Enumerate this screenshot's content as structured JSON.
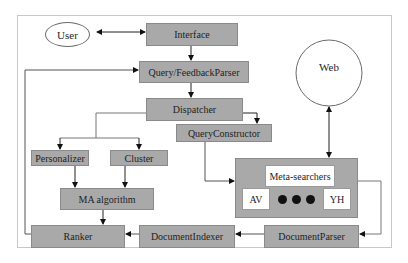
{
  "diagram": {
    "nodes": {
      "user": "User",
      "web": "Web",
      "interface": "Interface",
      "query_feedback_parser": "Query/FeedbackParser",
      "dispatcher": "Dispatcher",
      "personalizer": "Personalizer",
      "cluster": "Cluster",
      "query_constructor": "QueryConstructor",
      "ma_algorithm": "MA algorithm",
      "meta_searchers": "Meta-searchers",
      "av": "AV",
      "yh": "YH",
      "ranker": "Ranker",
      "document_indexer": "DocumentIndexer",
      "document_parser": "DocumentParser"
    },
    "edges": [
      {
        "from": "User",
        "to": "Interface",
        "bidirectional": true
      },
      {
        "from": "Interface",
        "to": "Query/FeedbackParser"
      },
      {
        "from": "Query/FeedbackParser",
        "to": "Dispatcher"
      },
      {
        "from": "Dispatcher",
        "to": "Personalizer"
      },
      {
        "from": "Dispatcher",
        "to": "Cluster"
      },
      {
        "from": "Dispatcher",
        "to": "QueryConstructor"
      },
      {
        "from": "Personalizer",
        "to": "MA algorithm"
      },
      {
        "from": "Cluster",
        "to": "MA algorithm"
      },
      {
        "from": "MA algorithm",
        "to": "Ranker"
      },
      {
        "from": "QueryConstructor",
        "to": "Meta-searchers"
      },
      {
        "from": "Web",
        "to": "Meta-searchers",
        "bidirectional": true
      },
      {
        "from": "Meta-searchers",
        "to": "DocumentParser"
      },
      {
        "from": "DocumentParser",
        "to": "DocumentIndexer"
      },
      {
        "from": "DocumentIndexer",
        "to": "Ranker"
      },
      {
        "from": "Ranker",
        "to": "Query/FeedbackParser"
      }
    ],
    "colors": {
      "box_fill": "#a9a9a9",
      "line": "#333333",
      "frame": "#c8c8c8"
    }
  }
}
